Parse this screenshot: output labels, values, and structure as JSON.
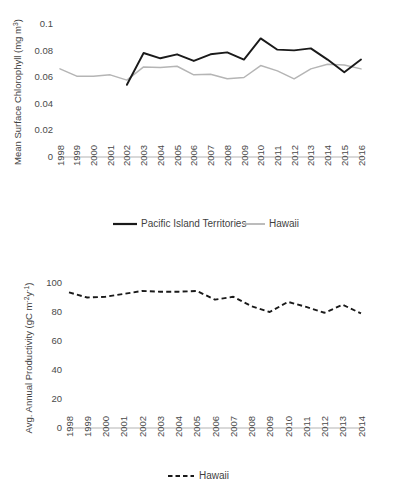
{
  "figure": {
    "background_color": "#ffffff",
    "text_color": "#3f3f3f",
    "axis_color": "#b3b3b3"
  },
  "chart_data": [
    {
      "id": "top",
      "type": "line",
      "title": "",
      "xlabel": "",
      "ylabel": "Mean Surface Chlorophyll (mg m3)",
      "ylabel_base": "Mean Surface Chlorophyll (mg m",
      "ylabel_sup": "3",
      "ylabel_tail": ")",
      "x": [
        1998,
        1999,
        2000,
        2001,
        2002,
        2003,
        2004,
        2005,
        2006,
        2007,
        2008,
        2009,
        2010,
        2011,
        2012,
        2013,
        2014,
        2015,
        2016
      ],
      "xtick_labels": [
        "1998",
        "1999",
        "2000",
        "2001",
        "2002",
        "2003",
        "2004",
        "2005",
        "2006",
        "2007",
        "2008",
        "2009",
        "2010",
        "2011",
        "2012",
        "2013",
        "2014",
        "2015",
        "2016"
      ],
      "ytick_labels": [
        "0.1",
        "0.08",
        "0.06",
        "0.04",
        "0.02",
        "0"
      ],
      "ytick_values": [
        0.1,
        0.08,
        0.06,
        0.04,
        0.02,
        0
      ],
      "ylim": [
        0,
        0.105
      ],
      "xlim": [
        1998,
        2016
      ],
      "grid": false,
      "legend_position": "bottom",
      "series": [
        {
          "name": "Pacific Island Territories",
          "color": "#1a1a1a",
          "style": "solid",
          "values": [
            null,
            null,
            null,
            null,
            0.0545,
            0.0785,
            0.0745,
            0.0775,
            0.0725,
            0.0775,
            0.079,
            0.0735,
            0.0895,
            0.081,
            0.0805,
            0.082,
            0.0735,
            0.064,
            0.0735
          ]
        },
        {
          "name": "Hawaii",
          "color": "#b5b5b5",
          "style": "solid",
          "values": [
            0.0665,
            0.061,
            0.061,
            0.062,
            0.058,
            0.068,
            0.0675,
            0.0685,
            0.062,
            0.0625,
            0.059,
            0.06,
            0.069,
            0.065,
            0.059,
            0.0665,
            0.07,
            0.0695,
            0.0665
          ]
        }
      ]
    },
    {
      "id": "bottom",
      "type": "line",
      "title": "",
      "xlabel": "",
      "ylabel": "Avg. Annual Productivity (gC m-2y-1)",
      "ylabel_base": "Avg. Annual Productivity (gC m",
      "ylabel_sup1": "-2",
      "ylabel_mid": "y",
      "ylabel_sup2": "-1",
      "ylabel_tail": ")",
      "x": [
        1998,
        1999,
        2000,
        2001,
        2002,
        2003,
        2004,
        2005,
        2006,
        2007,
        2008,
        2009,
        2010,
        2011,
        2012,
        2013,
        2014
      ],
      "xtick_labels": [
        "1998",
        "1999",
        "2000",
        "2001",
        "2002",
        "2003",
        "2004",
        "2005",
        "2006",
        "2007",
        "2008",
        "2009",
        "2010",
        "2011",
        "2012",
        "2013",
        "2014"
      ],
      "ytick_labels": [
        "100",
        "80",
        "60",
        "40",
        "20",
        "0"
      ],
      "ytick_values": [
        100,
        80,
        60,
        40,
        20,
        0
      ],
      "ylim": [
        0,
        106
      ],
      "xlim": [
        1998,
        2014
      ],
      "grid": false,
      "legend_position": "bottom",
      "series": [
        {
          "name": "Hawaii",
          "color": "#1a1a1a",
          "style": "dashed",
          "values": [
            93.5,
            90.0,
            90.5,
            92.5,
            94.5,
            94.0,
            94.0,
            94.5,
            88.5,
            90.5,
            84.0,
            80.0,
            87.0,
            83.5,
            79.5,
            85.0,
            79.0
          ]
        }
      ]
    }
  ],
  "legends": {
    "top": [
      {
        "label": "Pacific Island Territories",
        "style": "solid-black"
      },
      {
        "label": "Hawaii",
        "style": "solid-gray"
      }
    ],
    "bottom": [
      {
        "label": "Hawaii",
        "style": "dashed-black"
      }
    ]
  }
}
